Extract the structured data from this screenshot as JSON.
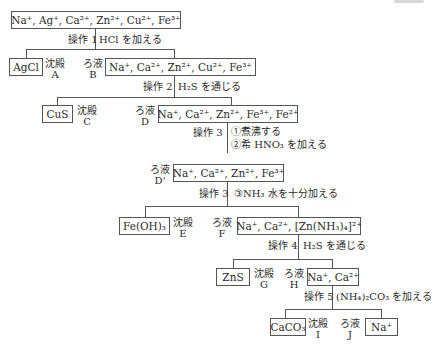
{
  "initial_solution": "Na⁺, Ag⁺, Ca²⁺, Zn²⁺, Cu²⁺, Fe³⁺",
  "steps": [
    {
      "op": "操作 1",
      "reagent": "HCl を加える"
    },
    {
      "op": "操作 2",
      "reagent": "H₂S を通じる"
    },
    {
      "op": "操作 3",
      "reagent_1": "①煮沸する",
      "reagent_2": "②希 HNO₃ を加える"
    },
    {
      "op": "操作 3",
      "reagent": "③NH₃ 水を十分加える"
    },
    {
      "op": "操作 4",
      "reagent": "H₂S を通じる"
    },
    {
      "op": "操作 5",
      "reagent": "(NH₄)₂CO₃ を加える"
    }
  ],
  "precipitates": [
    {
      "formula": "AgCl",
      "kind": "沈殿",
      "id": "A"
    },
    {
      "formula": "CuS",
      "kind": "沈殿",
      "id": "C"
    },
    {
      "formula": "Fe(OH)₃",
      "kind": "沈殿",
      "id": "E"
    },
    {
      "formula": "ZnS",
      "kind": "沈殿",
      "id": "G"
    },
    {
      "formula": "CaCO₃",
      "kind": "沈殿",
      "id": "I"
    }
  ],
  "filtrates": [
    {
      "ions": "Na⁺, Ca²⁺, Zn²⁺, Cu²⁺, Fe³⁺",
      "kind": "ろ液",
      "id": "B"
    },
    {
      "ions": "Na⁺, Ca²⁺, Zn²⁺, Fe³⁺, Fe²⁺",
      "kind": "ろ液",
      "id": "D"
    },
    {
      "ions": "Na⁺, Ca²⁺, Zn²⁺, Fe³⁺",
      "kind": "ろ液",
      "id": "D'"
    },
    {
      "ions": "Na⁺, Ca²⁺, [Zn(NH₃)₄]²⁺",
      "kind": "ろ液",
      "id": "F"
    },
    {
      "ions": "Na⁺, Ca²⁺",
      "kind": "ろ液",
      "id": "H"
    },
    {
      "ions": "Na⁺",
      "kind": "ろ液",
      "id": "J"
    }
  ]
}
